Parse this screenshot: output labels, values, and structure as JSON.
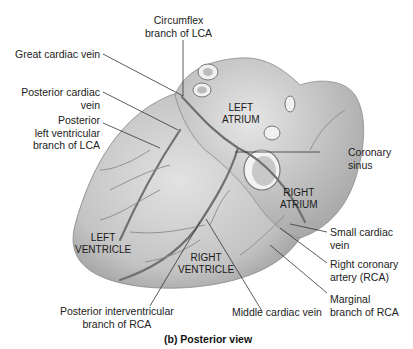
{
  "figure": {
    "caption": "(b) Posterior view"
  },
  "organ_labels": {
    "left_atrium": [
      "LEFT",
      "ATRIUM"
    ],
    "right_atrium": [
      "RIGHT",
      "ATRIUM"
    ],
    "left_ventricle": [
      "LEFT",
      "VENTRICLE"
    ],
    "right_ventricle": [
      "RIGHT",
      "VENTRICLE"
    ]
  },
  "callouts": {
    "circumflex": [
      "Circumflex",
      "branch of LCA"
    ],
    "great_cardiac_vein": [
      "Great cardiac vein"
    ],
    "posterior_cardiac_vein": [
      "Posterior cardiac",
      "vein"
    ],
    "posterior_lv_branch": [
      "Posterior",
      "left ventricular",
      "branch of LCA"
    ],
    "coronary_sinus": [
      "Coronary",
      "sinus"
    ],
    "small_cardiac_vein": [
      "Small cardiac",
      "vein"
    ],
    "rca": [
      "Right coronary",
      "artery (RCA)"
    ],
    "marginal_branch": [
      "Marginal",
      "branch of RCA"
    ],
    "middle_cardiac_vein": [
      "Middle cardiac vein"
    ],
    "posterior_interventricular": [
      "Posterior interventricular",
      "branch of RCA"
    ]
  },
  "colors": {
    "heart_fill": "#c9c9c9",
    "heart_shade": "#9a9a9a",
    "vessel": "#6e6e6e",
    "leader": "#333333",
    "text": "#222222"
  }
}
